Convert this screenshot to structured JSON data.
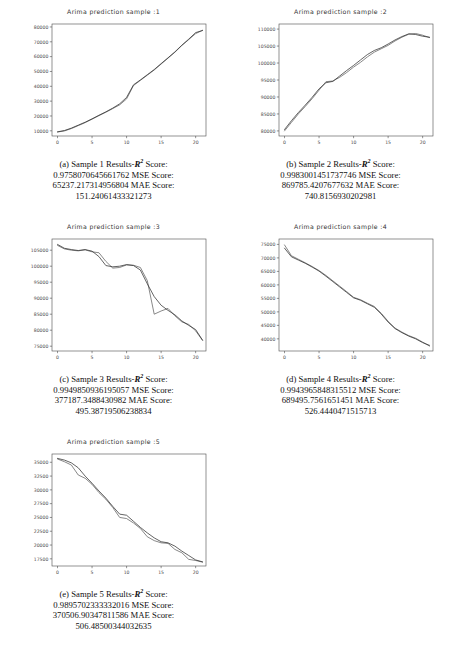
{
  "figure": {
    "panel_count": 5,
    "axis_color": "#4a4a4a",
    "line_colors": [
      "#606060",
      "#303030"
    ]
  },
  "panels": [
    {
      "letter": "(a)",
      "title": "Arima  prediction sample :1",
      "caption_prefix": "Sample 1 Results-",
      "r2_label": "Score:",
      "r2_value": "0.9758070645661762",
      "mse_label": "MSE Score:",
      "mse_value": "65237.217314956804",
      "mae_label": "MAE Score:",
      "mae_value": "151.24061433321273"
    },
    {
      "letter": "(b)",
      "title": "Arima  prediction sample :2",
      "caption_prefix": "Sample 2 Results-",
      "r2_label": "Score:",
      "r2_value": "0.9983001451737746",
      "mse_label": "MSE Score:",
      "mse_value": "869785.4207677632",
      "mae_label": "MAE Score:",
      "mae_value": "740.8156930202981"
    },
    {
      "letter": "(c)",
      "title": "Arima  prediction sample :3",
      "caption_prefix": "Sample 3 Results-",
      "r2_label": "Score:",
      "r2_value": "0.9949850936195057",
      "mse_label": "MSE Score:",
      "mse_value": "377187.3488430982",
      "mae_label": "MAE Score:",
      "mae_value": "495.38719506238834"
    },
    {
      "letter": "(d)",
      "title": "Arima  prediction sample :4",
      "caption_prefix": "Sample 4 Results-",
      "r2_label": "Score:",
      "r2_value": "0.9943965848315512",
      "mse_label": "MSE Score:",
      "mse_value": "689495.7561651451",
      "mae_label": "MAE Score:",
      "mae_value": "526.4440471515713"
    },
    {
      "letter": "(e)",
      "title": "Arima  prediction sample :5",
      "caption_prefix": "Sample 5 Results-",
      "r2_label": "Score:",
      "r2_value": "0.9895702333332016",
      "mse_label": "MSE Score:",
      "mse_value": "370506.90347811586",
      "mae_label": "MAE Score:",
      "mae_value": "506.48500344032635"
    }
  ],
  "chart_data": [
    {
      "type": "line",
      "title": "Arima  prediction sample :1",
      "xlabel": "",
      "ylabel": "",
      "grid": false,
      "legend": "none",
      "xlim": [
        -0.8,
        21.5
      ],
      "ylim": [
        6500,
        82000
      ],
      "xticks": [
        0,
        5,
        10,
        15,
        20
      ],
      "yticks": [
        10000,
        20000,
        30000,
        40000,
        50000,
        60000,
        70000,
        80000
      ],
      "x": [
        0,
        1,
        2,
        3,
        4,
        5,
        6,
        7,
        8,
        9,
        10,
        11,
        12,
        13,
        14,
        15,
        16,
        17,
        18,
        19,
        20,
        21
      ],
      "series": [
        {
          "name": "actual",
          "values": [
            9200,
            9900,
            11500,
            13500,
            15500,
            17800,
            20200,
            22500,
            25000,
            27500,
            31500,
            40500,
            44000,
            47500,
            51000,
            55000,
            59000,
            63000,
            67500,
            71500,
            75500,
            77800
          ]
        },
        {
          "name": "predicted",
          "values": [
            9300,
            10200,
            11800,
            13800,
            15800,
            18100,
            20500,
            22800,
            25300,
            28200,
            32500,
            41000,
            44300,
            47800,
            51300,
            55300,
            59200,
            63200,
            67700,
            71800,
            76200,
            77600
          ]
        }
      ]
    },
    {
      "type": "line",
      "title": "Arima  prediction sample :2",
      "xlabel": "",
      "ylabel": "",
      "grid": false,
      "legend": "none",
      "xlim": [
        -0.8,
        21.5
      ],
      "ylim": [
        78500,
        111500
      ],
      "xticks": [
        0,
        5,
        10,
        15,
        20
      ],
      "yticks": [
        80000,
        85000,
        90000,
        95000,
        100000,
        105000,
        110000
      ],
      "x": [
        0,
        1,
        2,
        3,
        4,
        5,
        6,
        7,
        8,
        9,
        10,
        11,
        12,
        13,
        14,
        15,
        16,
        17,
        18,
        19,
        20,
        21
      ],
      "series": [
        {
          "name": "actual",
          "values": [
            80000,
            82500,
            85000,
            87200,
            89500,
            92000,
            94500,
            94700,
            95800,
            97200,
            98800,
            100200,
            101800,
            103200,
            104200,
            105200,
            106500,
            107600,
            108500,
            108700,
            108200,
            107500
          ]
        },
        {
          "name": "predicted",
          "values": [
            80400,
            83000,
            85400,
            87600,
            89900,
            92400,
            94200,
            94600,
            96200,
            97800,
            99300,
            100900,
            102500,
            103700,
            104500,
            105600,
            106800,
            107800,
            108600,
            108400,
            107900,
            107600
          ]
        }
      ]
    },
    {
      "type": "line",
      "title": "Arima  prediction sample :3",
      "xlabel": "",
      "ylabel": "",
      "grid": false,
      "legend": "none",
      "xlim": [
        -0.8,
        21.5
      ],
      "ylim": [
        73500,
        108500
      ],
      "xticks": [
        0,
        5,
        10,
        15,
        20
      ],
      "yticks": [
        75000,
        80000,
        85000,
        90000,
        95000,
        100000,
        105000
      ],
      "x": [
        0,
        1,
        2,
        3,
        4,
        5,
        6,
        7,
        8,
        9,
        10,
        11,
        12,
        13,
        14,
        15,
        16,
        17,
        18,
        19,
        20,
        21
      ],
      "series": [
        {
          "name": "actual",
          "values": [
            106500,
            105400,
            105000,
            104800,
            105100,
            104500,
            104200,
            101500,
            99400,
            99600,
            100400,
            100300,
            99600,
            95500,
            85000,
            86000,
            86800,
            84500,
            82600,
            81800,
            79800,
            76800
          ]
        },
        {
          "name": "predicted",
          "values": [
            106800,
            105600,
            105200,
            104900,
            105200,
            104700,
            103000,
            100200,
            99800,
            100000,
            100500,
            100200,
            98800,
            94500,
            90500,
            87800,
            86200,
            84800,
            82900,
            81500,
            80200,
            76900
          ]
        }
      ]
    },
    {
      "type": "line",
      "title": "Arima  prediction sample :4",
      "xlabel": "",
      "ylabel": "",
      "grid": false,
      "legend": "none",
      "xlim": [
        -0.8,
        21.5
      ],
      "ylim": [
        35500,
        77000
      ],
      "xticks": [
        0,
        5,
        10,
        15,
        20
      ],
      "yticks": [
        40000,
        45000,
        50000,
        55000,
        60000,
        65000,
        70000,
        75000
      ],
      "x": [
        0,
        1,
        2,
        3,
        4,
        5,
        6,
        7,
        8,
        9,
        10,
        11,
        12,
        13,
        14,
        15,
        16,
        17,
        18,
        19,
        20,
        21
      ],
      "series": [
        {
          "name": "actual",
          "values": [
            74800,
            70800,
            69500,
            68200,
            66800,
            65300,
            63500,
            61500,
            59500,
            57500,
            55400,
            54500,
            53200,
            52000,
            49500,
            46500,
            44000,
            42500,
            41200,
            40200,
            38800,
            37300
          ]
        },
        {
          "name": "predicted",
          "values": [
            73600,
            70400,
            69200,
            68000,
            66600,
            65100,
            63200,
            61200,
            59200,
            57200,
            55200,
            54300,
            53000,
            51700,
            49200,
            46200,
            43800,
            42300,
            41000,
            40000,
            38600,
            37600
          ]
        }
      ]
    },
    {
      "type": "line",
      "title": "Arima  prediction sample :5",
      "xlabel": "",
      "ylabel": "",
      "grid": false,
      "legend": "none",
      "xlim": [
        -0.8,
        21.5
      ],
      "ylim": [
        16200,
        36500
      ],
      "xticks": [
        0,
        5,
        10,
        15,
        20
      ],
      "yticks": [
        17500,
        20000,
        22500,
        25000,
        27500,
        30000,
        32500,
        35000
      ],
      "x": [
        0,
        1,
        2,
        3,
        4,
        5,
        6,
        7,
        8,
        9,
        10,
        11,
        12,
        13,
        14,
        15,
        16,
        17,
        18,
        19,
        20,
        21
      ],
      "series": [
        {
          "name": "actual",
          "values": [
            35600,
            35100,
            34500,
            32700,
            32100,
            31000,
            29500,
            28300,
            26800,
            25000,
            24800,
            24000,
            23000,
            21500,
            20800,
            20400,
            20300,
            19200,
            18600,
            17400,
            17200,
            16900
          ]
        },
        {
          "name": "predicted",
          "values": [
            35700,
            35400,
            34900,
            34000,
            32500,
            31200,
            29800,
            28500,
            27000,
            25600,
            25400,
            24300,
            23200,
            22200,
            21300,
            20600,
            20400,
            19800,
            18900,
            18100,
            17300,
            16950
          ]
        }
      ]
    }
  ]
}
